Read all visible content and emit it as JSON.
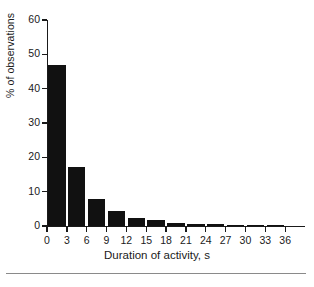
{
  "chart_data": {
    "type": "bar",
    "title": "",
    "subtitle": "",
    "xlabel": "Duration of activity, s",
    "ylabel": "% of observations",
    "categories": [
      "3",
      "6",
      "9",
      "12",
      "15",
      "18",
      "21",
      "24",
      "27",
      "30",
      "33",
      "36"
    ],
    "values": [
      47,
      17.2,
      8,
      4.4,
      2.2,
      1.8,
      0.9,
      0.7,
      0.5,
      0.4,
      0.3,
      0.3
    ],
    "x_tick_labels": [
      "0",
      "3",
      "6",
      "9",
      "12",
      "15",
      "18",
      "21",
      "24",
      "27",
      "30",
      "33",
      "36"
    ],
    "y_tick_labels": [
      "0",
      "10",
      "20",
      "30",
      "40",
      "50",
      "60"
    ],
    "y_ticks": [
      0,
      10,
      20,
      30,
      40,
      50,
      60
    ],
    "xlim": [
      0,
      39
    ],
    "ylim": [
      0,
      60
    ],
    "grid": false,
    "legend": null,
    "bar_color": "#111111",
    "axis_color": "#1a1a1a"
  },
  "figure": {
    "background_color": "#ffffff",
    "footer_rule_color": "#8a8a8a"
  }
}
